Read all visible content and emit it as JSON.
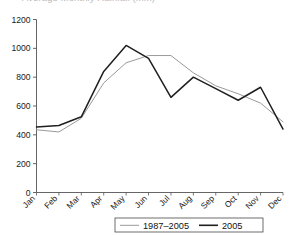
{
  "chart_data": {
    "type": "line",
    "title": "Average Monthly Rainfall (mm)",
    "xlabel": "",
    "ylabel": "",
    "ylim": [
      0,
      1200
    ],
    "yticks": [
      0,
      200,
      400,
      600,
      800,
      1000,
      1200
    ],
    "ytick_labels": [
      "0",
      "200",
      "400",
      "600",
      "800",
      "1000",
      "1200"
    ],
    "categories": [
      "Jan",
      "Feb",
      "Mar",
      "Apr",
      "May",
      "Jun",
      "Jul",
      "Aug",
      "Sep",
      "Oct",
      "Nov",
      "Dec"
    ],
    "grid": false,
    "legend_position": "bottom",
    "series": [
      {
        "name": "1987–2005",
        "color": "#9a9a9a",
        "width": 1.0,
        "values": [
          435,
          420,
          515,
          760,
          900,
          950,
          950,
          830,
          740,
          685,
          620,
          490
        ]
      },
      {
        "name": "2005",
        "color": "#1f1f1f",
        "width": 1.5,
        "values": [
          455,
          465,
          525,
          840,
          1020,
          930,
          660,
          800,
          720,
          640,
          730,
          440
        ]
      }
    ]
  },
  "legend": {
    "items": [
      {
        "label": "1987–2005"
      },
      {
        "label": "2005"
      }
    ]
  },
  "colors": {
    "axis": "#555555",
    "text": "#111111",
    "series_mean": "#9a9a9a",
    "series_2005": "#1f1f1f",
    "title_faded": "#b9b9b9"
  }
}
